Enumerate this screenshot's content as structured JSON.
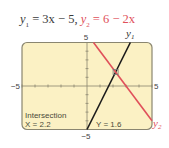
{
  "chart_data": {
    "type": "line",
    "title_parts": {
      "eq1_lhs": "y",
      "eq1_sub": "1",
      "eq1_rhs": " = 3x − 5, ",
      "eq2_lhs": "y",
      "eq2_sub": "2",
      "eq2_rhs": " = 6 − 2x"
    },
    "xlim": [
      -5,
      5
    ],
    "ylim": [
      -5,
      5
    ],
    "xticks_step": 1,
    "yticks_step": 1,
    "tick_labels": {
      "xmin": "−5",
      "xmax": "5",
      "ymin": "−5",
      "ymax": "5"
    },
    "series": [
      {
        "name": "y1",
        "label": "y",
        "label_sub": "1",
        "slope": 3,
        "intercept": -5,
        "color": "#1a1a1a"
      },
      {
        "name": "y2",
        "label": "y",
        "label_sub": "2",
        "slope": -2,
        "intercept": 6,
        "color": "#e0505a"
      }
    ],
    "intersection": {
      "x": 2.2,
      "y": 1.6
    },
    "readout": {
      "heading": "Intersection",
      "x_text": "X = 2.2",
      "y_text": "Y = 1.6"
    },
    "screen_color": "#fbf1c4",
    "frame_color": "#8a8670"
  }
}
